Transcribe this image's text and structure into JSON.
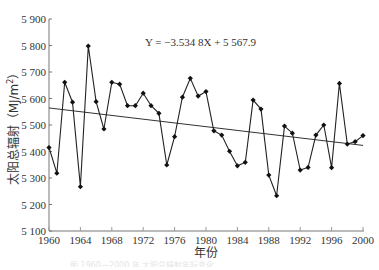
{
  "chart_data": {
    "type": "line",
    "title": "",
    "xlabel": "年份",
    "ylabel": "太阳总辐射（MJ/m²）",
    "ylabel_parts": {
      "main": "太阳总辐射",
      "unit": "（MJ/m",
      "sup": "2",
      "close": "）"
    },
    "xlim": [
      1960,
      2000
    ],
    "ylim": [
      5100,
      5900
    ],
    "x_ticks": [
      1960,
      1964,
      1968,
      1972,
      1976,
      1980,
      1984,
      1988,
      1992,
      1996,
      2000
    ],
    "y_ticks": [
      5100,
      5200,
      5300,
      5400,
      5500,
      5600,
      5700,
      5800,
      5900
    ],
    "y_tick_labels": [
      "5 100",
      "5 200",
      "5 300",
      "5 400",
      "5 500",
      "5 600",
      "5 700",
      "5 800",
      "5 900"
    ],
    "grid": false,
    "legend": null,
    "annotation": "Y = −3.534 8X + 5 567.9",
    "trendline": {
      "slope": -3.5348,
      "intercept": 5567.9,
      "x_index_start": 1
    },
    "series": [
      {
        "name": "太阳总辐射",
        "marker": "diamond",
        "x": [
          1960,
          1961,
          1962,
          1963,
          1964,
          1965,
          1966,
          1967,
          1968,
          1969,
          1970,
          1971,
          1972,
          1973,
          1974,
          1975,
          1976,
          1977,
          1978,
          1979,
          1980,
          1981,
          1982,
          1983,
          1984,
          1985,
          1986,
          1987,
          1988,
          1989,
          1990,
          1991,
          1992,
          1993,
          1994,
          1995,
          1996,
          1997,
          1998,
          1999,
          2000
        ],
        "values": [
          5415,
          5318,
          5661,
          5586,
          5267,
          5798,
          5588,
          5485,
          5661,
          5654,
          5573,
          5573,
          5620,
          5573,
          5544,
          5349,
          5456,
          5605,
          5676,
          5609,
          5626,
          5478,
          5462,
          5401,
          5346,
          5359,
          5594,
          5560,
          5311,
          5233,
          5496,
          5469,
          5330,
          5340,
          5462,
          5500,
          5339,
          5657,
          5428,
          5437,
          5460
        ]
      }
    ]
  },
  "caption": "图  1960—2000 年 太阳总辐射年际变化"
}
